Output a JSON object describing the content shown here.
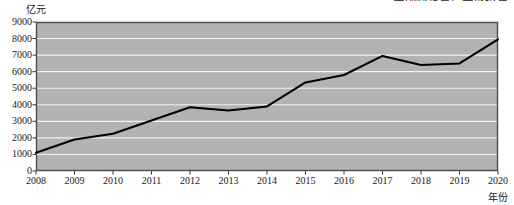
{
  "figure": {
    "top_caption": "中国固定资产完成投资",
    "y_axis_unit": "亿元",
    "x_axis_title": "年份"
  },
  "chart_data": {
    "type": "line",
    "title": "中国固定资产完成投资",
    "xlabel": "年份",
    "ylabel": "亿元",
    "categories": [
      "2008",
      "2009",
      "2010",
      "2011",
      "2012",
      "2013",
      "2014",
      "2015",
      "2016",
      "2017",
      "2018",
      "2019",
      "2020"
    ],
    "values": [
      1100,
      1900,
      2250,
      3050,
      3850,
      3650,
      3900,
      5350,
      5800,
      6950,
      6400,
      6500,
      7950
    ],
    "ylim": [
      0,
      9000
    ],
    "yticks": [
      0,
      1000,
      2000,
      3000,
      4000,
      5000,
      6000,
      7000,
      8000,
      9000
    ],
    "ytick_labels": [
      "0",
      "1000",
      "2000",
      "3000",
      "4000",
      "5000",
      "6000",
      "7000",
      "8000",
      "9000"
    ],
    "grid": true,
    "grid_color": "#f2f2f2",
    "plot_background": "#b3b3b3",
    "line_color": "#000000",
    "line_width": 2,
    "legend": null,
    "legend_position": "none"
  }
}
